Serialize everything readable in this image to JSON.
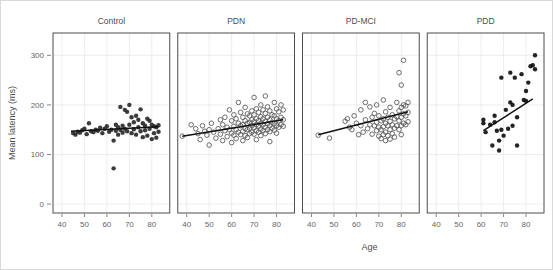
{
  "chart_data": {
    "type": "scatter",
    "title": "",
    "xlabel": "Age",
    "ylabel": "Mean latency (ms)",
    "xlim": [
      36,
      88
    ],
    "ylim": [
      -18,
      345
    ],
    "xticks": [
      40,
      50,
      60,
      70,
      80
    ],
    "yticks": [
      0,
      100,
      200,
      300
    ],
    "xtick_labels": [
      "40",
      "50",
      "60",
      "70",
      "80"
    ],
    "ytick_labels": [
      "0",
      "100",
      "200",
      "300"
    ],
    "grid": true,
    "legend": "none",
    "facet_layout": "1 row x 4 columns",
    "panels": [
      {
        "label": "Control",
        "marker": "filled-circle",
        "marker_color": "#2b2b2b",
        "fit_line": {
          "x": [
            44,
            83
          ],
          "y": [
            147,
            156
          ]
        },
        "points": [
          [
            45,
            143
          ],
          [
            46,
            140
          ],
          [
            47,
            146
          ],
          [
            48,
            144
          ],
          [
            49,
            149
          ],
          [
            50,
            152
          ],
          [
            51,
            141
          ],
          [
            52,
            163
          ],
          [
            53,
            147
          ],
          [
            54,
            145
          ],
          [
            55,
            150
          ],
          [
            56,
            148
          ],
          [
            57,
            154
          ],
          [
            58,
            143
          ],
          [
            59,
            152
          ],
          [
            60,
            157
          ],
          [
            61,
            146
          ],
          [
            62,
            150
          ],
          [
            63,
            72
          ],
          [
            63,
            128
          ],
          [
            64,
            160
          ],
          [
            64,
            148
          ],
          [
            65,
            155
          ],
          [
            65,
            140
          ],
          [
            66,
            196
          ],
          [
            66,
            150
          ],
          [
            67,
            158
          ],
          [
            67,
            144
          ],
          [
            68,
            190
          ],
          [
            68,
            152
          ],
          [
            69,
            186
          ],
          [
            69,
            147
          ],
          [
            70,
            200
          ],
          [
            70,
            160
          ],
          [
            71,
            175
          ],
          [
            71,
            143
          ],
          [
            72,
            165
          ],
          [
            72,
            151
          ],
          [
            73,
            178
          ],
          [
            73,
            140
          ],
          [
            74,
            170
          ],
          [
            74,
            155
          ],
          [
            75,
            191
          ],
          [
            75,
            147
          ],
          [
            76,
            163
          ],
          [
            76,
            135
          ],
          [
            77,
            158
          ],
          [
            77,
            149
          ],
          [
            78,
            172
          ],
          [
            78,
            138
          ],
          [
            79,
            168
          ],
          [
            79,
            152
          ],
          [
            80,
            160
          ],
          [
            80,
            131
          ],
          [
            81,
            157
          ],
          [
            81,
            143
          ],
          [
            82,
            155
          ],
          [
            82,
            134
          ],
          [
            83,
            159
          ],
          [
            83,
            146
          ]
        ]
      },
      {
        "label": "PDN",
        "marker": "open-circle",
        "marker_color": "#555555",
        "fit_line": {
          "x": [
            38,
            83
          ],
          "y": [
            137,
            170
          ]
        },
        "points": [
          [
            38,
            137
          ],
          [
            42,
            160
          ],
          [
            44,
            152
          ],
          [
            45,
            142
          ],
          [
            46,
            130
          ],
          [
            47,
            158
          ],
          [
            48,
            147
          ],
          [
            49,
            139
          ],
          [
            50,
            150
          ],
          [
            50,
            119
          ],
          [
            51,
            163
          ],
          [
            52,
            145
          ],
          [
            53,
            133
          ],
          [
            54,
            152
          ],
          [
            55,
            170
          ],
          [
            55,
            141
          ],
          [
            56,
            160
          ],
          [
            56,
            128
          ],
          [
            57,
            175
          ],
          [
            57,
            148
          ],
          [
            58,
            155
          ],
          [
            58,
            136
          ],
          [
            59,
            190
          ],
          [
            59,
            150
          ],
          [
            60,
            168
          ],
          [
            60,
            143
          ],
          [
            60,
            124
          ],
          [
            61,
            180
          ],
          [
            61,
            157
          ],
          [
            61,
            139
          ],
          [
            62,
            172
          ],
          [
            62,
            150
          ],
          [
            62,
            132
          ],
          [
            63,
            205
          ],
          [
            63,
            163
          ],
          [
            63,
            145
          ],
          [
            64,
            185
          ],
          [
            64,
            158
          ],
          [
            64,
            140
          ],
          [
            65,
            175
          ],
          [
            65,
            160
          ],
          [
            65,
            147
          ],
          [
            65,
            128
          ],
          [
            66,
            195
          ],
          [
            66,
            168
          ],
          [
            66,
            152
          ],
          [
            66,
            138
          ],
          [
            67,
            182
          ],
          [
            67,
            163
          ],
          [
            67,
            150
          ],
          [
            67,
            134
          ],
          [
            68,
            178
          ],
          [
            68,
            165
          ],
          [
            68,
            153
          ],
          [
            68,
            142
          ],
          [
            69,
            188
          ],
          [
            69,
            170
          ],
          [
            69,
            158
          ],
          [
            69,
            145
          ],
          [
            70,
            215
          ],
          [
            70,
            180
          ],
          [
            70,
            166
          ],
          [
            70,
            154
          ],
          [
            70,
            141
          ],
          [
            71,
            192
          ],
          [
            71,
            172
          ],
          [
            71,
            160
          ],
          [
            71,
            148
          ],
          [
            71,
            130
          ],
          [
            72,
            185
          ],
          [
            72,
            168
          ],
          [
            72,
            157
          ],
          [
            72,
            145
          ],
          [
            73,
            200
          ],
          [
            73,
            176
          ],
          [
            73,
            163
          ],
          [
            73,
            151
          ],
          [
            73,
            138
          ],
          [
            74,
            190
          ],
          [
            74,
            172
          ],
          [
            74,
            160
          ],
          [
            74,
            148
          ],
          [
            75,
            218
          ],
          [
            75,
            183
          ],
          [
            75,
            167
          ],
          [
            75,
            155
          ],
          [
            75,
            142
          ],
          [
            76,
            196
          ],
          [
            76,
            175
          ],
          [
            76,
            162
          ],
          [
            76,
            150
          ],
          [
            77,
            188
          ],
          [
            77,
            170
          ],
          [
            77,
            158
          ],
          [
            77,
            146
          ],
          [
            77,
            126
          ],
          [
            78,
            180
          ],
          [
            78,
            165
          ],
          [
            78,
            153
          ],
          [
            79,
            205
          ],
          [
            79,
            178
          ],
          [
            79,
            162
          ],
          [
            79,
            149
          ],
          [
            80,
            192
          ],
          [
            80,
            172
          ],
          [
            80,
            158
          ],
          [
            80,
            143
          ],
          [
            81,
            186
          ],
          [
            81,
            168
          ],
          [
            81,
            155
          ],
          [
            82,
            200
          ],
          [
            82,
            175
          ],
          [
            82,
            160
          ],
          [
            83,
            190
          ],
          [
            83,
            170
          ],
          [
            83,
            157
          ]
        ]
      },
      {
        "label": "PD-MCI",
        "marker": "open-circle",
        "marker_color": "#555555",
        "fit_line": {
          "x": [
            43,
            83
          ],
          "y": [
            140,
            186
          ]
        },
        "points": [
          [
            43,
            139
          ],
          [
            48,
            133
          ],
          [
            55,
            167
          ],
          [
            56,
            172
          ],
          [
            57,
            155
          ],
          [
            58,
            150
          ],
          [
            59,
            178
          ],
          [
            60,
            163
          ],
          [
            61,
            140
          ],
          [
            62,
            190
          ],
          [
            62,
            158
          ],
          [
            63,
            145
          ],
          [
            64,
            205
          ],
          [
            64,
            170
          ],
          [
            65,
            152
          ],
          [
            66,
            196
          ],
          [
            66,
            160
          ],
          [
            67,
            175
          ],
          [
            67,
            141
          ],
          [
            68,
            183
          ],
          [
            68,
            158
          ],
          [
            69,
            200
          ],
          [
            69,
            165
          ],
          [
            69,
            148
          ],
          [
            70,
            178
          ],
          [
            70,
            155
          ],
          [
            70,
            137
          ],
          [
            71,
            168
          ],
          [
            71,
            150
          ],
          [
            71,
            132
          ],
          [
            72,
            210
          ],
          [
            72,
            172
          ],
          [
            72,
            156
          ],
          [
            72,
            140
          ],
          [
            73,
            186
          ],
          [
            73,
            163
          ],
          [
            73,
            145
          ],
          [
            73,
            128
          ],
          [
            74,
            175
          ],
          [
            74,
            158
          ],
          [
            74,
            138
          ],
          [
            75,
            195
          ],
          [
            75,
            167
          ],
          [
            75,
            150
          ],
          [
            75,
            131
          ],
          [
            76,
            180
          ],
          [
            76,
            160
          ],
          [
            76,
            142
          ],
          [
            77,
            172
          ],
          [
            77,
            153
          ],
          [
            77,
            135
          ],
          [
            78,
            205
          ],
          [
            78,
            176
          ],
          [
            78,
            158
          ],
          [
            79,
            265
          ],
          [
            79,
            188
          ],
          [
            79,
            168
          ],
          [
            79,
            150
          ],
          [
            80,
            240
          ],
          [
            80,
            195
          ],
          [
            80,
            175
          ],
          [
            80,
            158
          ],
          [
            80,
            140
          ],
          [
            81,
            290
          ],
          [
            81,
            200
          ],
          [
            81,
            182
          ],
          [
            81,
            163
          ],
          [
            82,
            198
          ],
          [
            82,
            178
          ],
          [
            82,
            160
          ],
          [
            83,
            205
          ],
          [
            83,
            185
          ],
          [
            83,
            166
          ]
        ]
      },
      {
        "label": "PDD",
        "marker": "filled-circle",
        "marker_color": "#111111",
        "fit_line": {
          "x": [
            61,
            83
          ],
          "y": [
            148,
            212
          ]
        },
        "points": [
          [
            61,
            163
          ],
          [
            61,
            170
          ],
          [
            62,
            145
          ],
          [
            64,
            160
          ],
          [
            65,
            118
          ],
          [
            66,
            165
          ],
          [
            66,
            178
          ],
          [
            67,
            148
          ],
          [
            68,
            128
          ],
          [
            68,
            108
          ],
          [
            69,
            255
          ],
          [
            69,
            150
          ],
          [
            70,
            138
          ],
          [
            71,
            190
          ],
          [
            72,
            152
          ],
          [
            73,
            265
          ],
          [
            73,
            205
          ],
          [
            74,
            200
          ],
          [
            74,
            158
          ],
          [
            75,
            255
          ],
          [
            76,
            175
          ],
          [
            76,
            118
          ],
          [
            78,
            262
          ],
          [
            79,
            210
          ],
          [
            80,
            228
          ],
          [
            80,
            208
          ],
          [
            81,
            245
          ],
          [
            82,
            278
          ],
          [
            83,
            280
          ],
          [
            84,
            272
          ],
          [
            84,
            300
          ]
        ]
      }
    ]
  },
  "colors": {
    "panel_border": "#4d4d4d",
    "grid": "#e8e8e8",
    "fit_line": "#111111",
    "axis_text": "#666666",
    "outer_border": "#d9d9d9",
    "background": "#ffffff"
  }
}
